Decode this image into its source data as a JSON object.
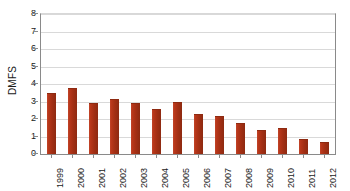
{
  "chart_data": {
    "type": "bar",
    "title": "",
    "xlabel": "",
    "ylabel": "DMFS",
    "ylim": [
      0,
      8
    ],
    "yticks": [
      "0",
      "1",
      "2",
      "3",
      "4",
      "5",
      "6",
      "7",
      "8"
    ],
    "grid": true,
    "legend": "none",
    "categories": [
      "1999",
      "2000",
      "2001",
      "2002",
      "2003",
      "2004",
      "2005",
      "2006",
      "2007",
      "2008",
      "2009",
      "2010",
      "2011",
      "2012"
    ],
    "values": [
      3.5,
      3.8,
      2.9,
      3.15,
      2.9,
      2.55,
      3.0,
      2.3,
      2.2,
      1.8,
      1.4,
      1.5,
      0.85,
      0.7
    ],
    "series": [
      {
        "name": "DMFS",
        "values": [
          3.5,
          3.8,
          2.9,
          3.15,
          2.9,
          2.55,
          3.0,
          2.3,
          2.2,
          1.8,
          1.4,
          1.5,
          0.85,
          0.7
        ]
      }
    ]
  },
  "colors": {
    "bar_fill": "#a83218",
    "bar_edge": "#8e2a11",
    "gridline": "#d9d9d9",
    "axis": "#8a8a8a",
    "plot_background": "#ffffff",
    "text": "#1a1a1a"
  }
}
